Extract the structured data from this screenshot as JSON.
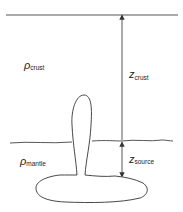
{
  "diagram": {
    "labels": {
      "rho_crust": {
        "symbol": "ρ",
        "subscript": "crust"
      },
      "rho_mantle": {
        "symbol": "ρ",
        "subscript": "mantle"
      },
      "z_crust": {
        "symbol": "z",
        "subscript": "crust"
      },
      "z_source": {
        "symbol": "z",
        "subscript": "source"
      }
    },
    "colors": {
      "stroke": "#333333",
      "background": "#ffffff"
    }
  }
}
